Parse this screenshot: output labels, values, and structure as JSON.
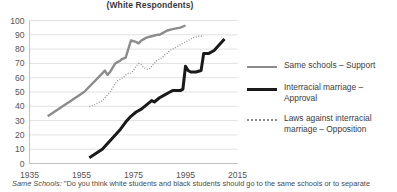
{
  "header": {
    "title": "(White Respondents)"
  },
  "footnote": {
    "source_label": "Same Schools:",
    "text": " \"Do you think white students and black students should go to the same schools or to separate"
  },
  "legend": {
    "position": "right",
    "items": [
      {
        "label": "Same schools – Support",
        "style": "solid",
        "color": "#8c8c8c",
        "width": 2.4,
        "name": "legend-same-schools"
      },
      {
        "label": "Interracial marriage – Approval",
        "style": "solid",
        "color": "#1a1a1a",
        "width": 3.0,
        "name": "legend-interracial-marriage"
      },
      {
        "label": "Laws against interracial\nmarriage – Opposition",
        "style": "dotted",
        "color": "#8c8c8c",
        "width": 1.4,
        "name": "legend-laws-against"
      }
    ]
  },
  "chart_data": {
    "type": "line",
    "title": "(White Respondents)",
    "xlabel": "",
    "ylabel": "",
    "xlim": [
      1935,
      2015
    ],
    "ylim": [
      0,
      100
    ],
    "xticks": [
      1935,
      1955,
      1975,
      1995,
      2015
    ],
    "yticks": [
      0,
      10,
      20,
      30,
      40,
      50,
      60,
      70,
      80,
      90,
      100
    ],
    "grid": "horizontal",
    "legend_position": "right",
    "series": [
      {
        "name": "Same schools – Support",
        "color": "#8c8c8c",
        "style": "solid",
        "width": 2.4,
        "x": [
          1942,
          1956,
          1963,
          1964,
          1965,
          1966,
          1968,
          1970,
          1970.5,
          1972,
          1974,
          1976,
          1977,
          1978,
          1980,
          1982,
          1984,
          1985,
          1986,
          1988,
          1990,
          1993,
          1995
        ],
        "y": [
          33,
          50,
          63,
          65,
          62,
          64,
          70,
          72,
          73,
          74,
          86,
          85,
          84,
          86,
          88,
          89,
          90,
          90,
          91,
          93,
          94,
          95,
          96.5
        ]
      },
      {
        "name": "Laws against interracial marriage – Opposition",
        "color": "#8c8c8c",
        "style": "dotted",
        "width": 1.4,
        "x": [
          1958,
          1960,
          1962,
          1963,
          1964,
          1965,
          1966,
          1967,
          1968,
          1969,
          1970,
          1971,
          1972,
          1973,
          1974,
          1975,
          1976,
          1977,
          1978,
          1979,
          1980,
          1981,
          1982,
          1983,
          1984,
          1985,
          1986,
          1987,
          1988,
          1989,
          1990,
          1991,
          1992,
          1993,
          1994,
          1995,
          1996,
          1997,
          1998,
          2000,
          2002
        ],
        "y": [
          40,
          41,
          43,
          44,
          46,
          48,
          50,
          53,
          56,
          58,
          59,
          60,
          62,
          63,
          63,
          65,
          68,
          70,
          69,
          67,
          66,
          66,
          68,
          70,
          72,
          73,
          74,
          76,
          77,
          79,
          80,
          81,
          82,
          83,
          84,
          85,
          86,
          87,
          88,
          89,
          89
        ]
      },
      {
        "name": "Interracial marriage – Approval",
        "color": "#1a1a1a",
        "style": "solid",
        "width": 3.0,
        "x": [
          1958,
          1963,
          1968,
          1970,
          1972,
          1974,
          1976,
          1978,
          1980,
          1982,
          1983,
          1985,
          1987,
          1989,
          1990,
          1991,
          1993,
          1994,
          1995,
          1996,
          1997,
          1999,
          2001,
          2002,
          2004,
          2006,
          2008,
          2010
        ],
        "y": [
          4,
          10,
          20,
          24,
          29,
          33,
          36,
          38,
          41,
          44,
          43,
          46,
          48,
          50,
          51,
          51,
          51,
          52,
          68,
          65,
          64,
          64,
          65,
          77,
          77,
          79,
          83,
          87
        ]
      }
    ]
  }
}
